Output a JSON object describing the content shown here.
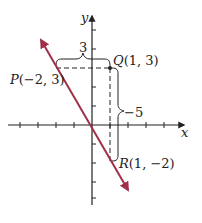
{
  "diagram": {
    "type": "coordinate-plane-slope",
    "axes": {
      "x_label": "x",
      "y_label": "y",
      "x_ticks": [
        -4,
        -3,
        -2,
        -1,
        1,
        2,
        3,
        4,
        5
      ],
      "y_ticks": [
        -5,
        -4,
        -3,
        -2,
        -1,
        1,
        2,
        3,
        4,
        5
      ]
    },
    "points": [
      {
        "name": "P",
        "label": "P(−2, 3)",
        "x": -2,
        "y": 3
      },
      {
        "name": "Q",
        "label": "Q(1, 3)",
        "x": 1,
        "y": 3
      },
      {
        "name": "R",
        "label": "R(1, −2)",
        "x": 1,
        "y": -2
      }
    ],
    "run_label": "3",
    "rise_label": "−5",
    "line": {
      "color": "#a0304a",
      "through": [
        "P",
        "R"
      ]
    },
    "colors": {
      "line": "#a0304a",
      "axes": "#222222",
      "dashed": "#222222"
    }
  }
}
